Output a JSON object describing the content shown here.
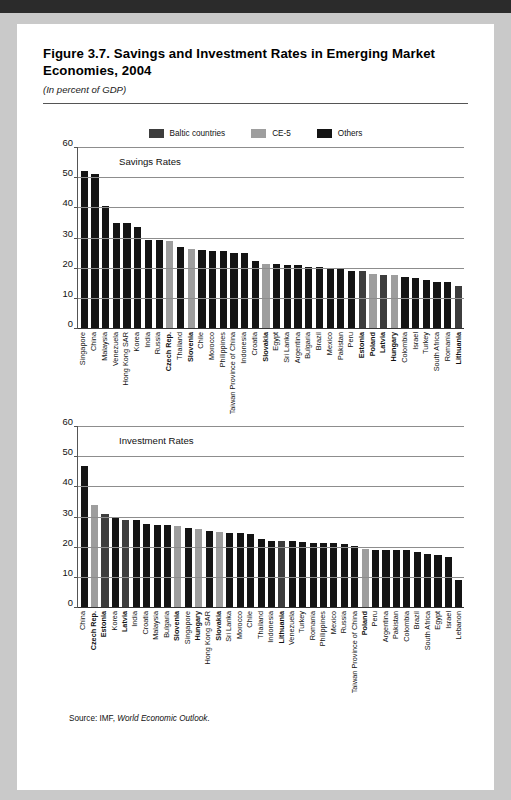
{
  "figure": {
    "title": "Figure 3.7. Savings and Investment Rates in Emerging Market Economies, 2004",
    "subtitle": "(In percent of GDP)",
    "source_prefix": "Source: IMF,",
    "source_italic": "World Economic Outlook",
    "source_suffix": "."
  },
  "legend": {
    "items": [
      {
        "label": "Baltic countries",
        "color": "#3d3d3d"
      },
      {
        "label": "CE-5",
        "color": "#9e9e9e"
      },
      {
        "label": "Others",
        "color": "#141414"
      }
    ]
  },
  "colors": {
    "baltic": "#3d3d3d",
    "ce5": "#9e9e9e",
    "others": "#141414",
    "gridline": "#8d8d8d",
    "axis": "#333333",
    "background": "#ffffff"
  },
  "chart_data": [
    {
      "type": "bar",
      "title": "Savings Rates",
      "xlabel": "",
      "ylabel": "",
      "ylim": [
        0,
        60
      ],
      "yticks": [
        0,
        10,
        20,
        30,
        40,
        50,
        60
      ],
      "grid": true,
      "legend_position": "top-center",
      "categories": [
        "Singapore",
        "China",
        "Malaysia",
        "Venezuela",
        "Hong Kong SAR",
        "Korea",
        "India",
        "Russia",
        "Czech Rep.",
        "Thailand",
        "Slovenia",
        "Chile",
        "Morocco",
        "Philippines",
        "Taiwan Province of China",
        "Indonesia",
        "Croatia",
        "Slovakia",
        "Egypt",
        "Sri Lanka",
        "Argentina",
        "Bulgaria",
        "Brazil",
        "Mexico",
        "Pakistan",
        "Peru",
        "Estonia",
        "Poland",
        "Latvia",
        "Hungary",
        "Colombia",
        "Israel",
        "Turkey",
        "South Africa",
        "Romania",
        "Lithuania"
      ],
      "values": [
        52.3,
        51.2,
        40.6,
        35.0,
        35.0,
        33.7,
        29.5,
        29.4,
        29.1,
        27.0,
        26.4,
        25.9,
        25.8,
        25.7,
        25.1,
        25.0,
        22.3,
        21.4,
        21.2,
        21.1,
        20.9,
        20.5,
        20.2,
        19.8,
        19.6,
        19.0,
        18.9,
        17.9,
        17.8,
        17.8,
        16.9,
        16.6,
        16.1,
        15.5,
        15.3,
        14.1
      ],
      "groups": [
        "others",
        "others",
        "others",
        "others",
        "others",
        "others",
        "others",
        "others",
        "ce5",
        "others",
        "ce5",
        "others",
        "others",
        "others",
        "others",
        "others",
        "others",
        "ce5",
        "others",
        "others",
        "others",
        "others",
        "others",
        "others",
        "others",
        "others",
        "baltic",
        "ce5",
        "baltic",
        "ce5",
        "others",
        "others",
        "others",
        "others",
        "others",
        "baltic"
      ],
      "bold_labels": [
        "Czech Rep.",
        "Slovenia",
        "Slovakia",
        "Estonia",
        "Poland",
        "Latvia",
        "Hungary",
        "Lithuania"
      ]
    },
    {
      "type": "bar",
      "title": "Investment Rates",
      "xlabel": "",
      "ylabel": "",
      "ylim": [
        0,
        60
      ],
      "yticks": [
        0,
        10,
        20,
        30,
        40,
        50,
        60
      ],
      "grid": true,
      "legend_position": "top-center",
      "categories": [
        "China",
        "Czech Rep.",
        "Estonia",
        "Korea",
        "Latvia",
        "India",
        "Croatia",
        "Malaysia",
        "Bulgaria",
        "Slovenia",
        "Singapore",
        "Hungary",
        "Hong Kong SAR",
        "Slovakia",
        "Sri Lanka",
        "Morocco",
        "Chile",
        "Thailand",
        "Indonesia",
        "Lithuania",
        "Venezuela",
        "Turkey",
        "Romania",
        "Philippines",
        "Mexico",
        "Russia",
        "Taiwan Province of China",
        "Poland",
        "Peru",
        "Argentina",
        "Pakistan",
        "Colombia",
        "Brazil",
        "South Africa",
        "Egypt",
        "Israel",
        "Lebanon"
      ],
      "values": [
        46.9,
        34.0,
        31.0,
        29.6,
        29.1,
        29.1,
        27.8,
        27.4,
        27.3,
        26.9,
        26.4,
        25.9,
        25.3,
        24.9,
        24.7,
        24.6,
        24.3,
        22.6,
        22.1,
        22.0,
        21.9,
        21.6,
        21.5,
        21.4,
        21.3,
        20.9,
        20.2,
        19.5,
        19.1,
        19.0,
        19.0,
        18.9,
        18.3,
        17.6,
        17.3,
        16.8,
        9.1
      ],
      "groups": [
        "others",
        "ce5",
        "baltic",
        "others",
        "baltic",
        "others",
        "others",
        "others",
        "others",
        "ce5",
        "others",
        "ce5",
        "others",
        "ce5",
        "others",
        "others",
        "others",
        "others",
        "others",
        "baltic",
        "others",
        "others",
        "others",
        "others",
        "others",
        "others",
        "others",
        "ce5",
        "others",
        "others",
        "others",
        "others",
        "others",
        "others",
        "others",
        "others",
        "others"
      ],
      "bold_labels": [
        "Czech Rep.",
        "Estonia",
        "Latvia",
        "Slovenia",
        "Hungary",
        "Slovakia",
        "Lithuania",
        "Poland"
      ]
    }
  ]
}
